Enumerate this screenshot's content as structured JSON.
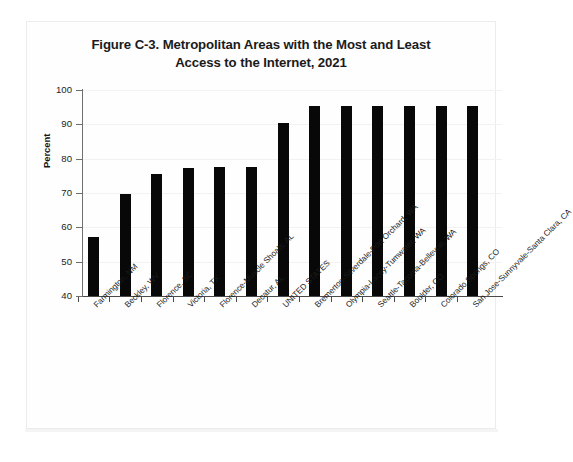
{
  "figure": {
    "title_line1": "Figure C-3. Metropolitan Areas with the Most and Least",
    "title_line2": "Access to the Internet, 2021"
  },
  "chart_data": {
    "type": "bar",
    "title": "Figure C-3. Metropolitan Areas with the Most and Least Access to the Internet, 2021",
    "xlabel": "",
    "ylabel": "Percent",
    "ylim": [
      40,
      100
    ],
    "yticks": [
      40,
      50,
      60,
      70,
      80,
      90,
      100
    ],
    "grid": true,
    "legend": "none",
    "bar_color": "#080808",
    "categories": [
      "Farmington, NM",
      "Beckley, WV",
      "Florence, SC",
      "Victoria, TX",
      "Florence-Muscle Shoals, AL",
      "Decatur, AL",
      "UNITED STATES",
      "Bremerton-Silverdale-Port Orchard, WA",
      "Olympia-Lacey-Tumwater, WA",
      "Seattle-Tacoma-Bellevue, WA",
      "Boulder, CO",
      "Colorado Springs, CO",
      "San Jose-Sunnyvale-Santa Clara, CA"
    ],
    "values": [
      57.3,
      69.7,
      75.6,
      77.4,
      77.5,
      77.7,
      90.3,
      95.2,
      95.2,
      95.2,
      95.2,
      95.4,
      95.4
    ]
  }
}
